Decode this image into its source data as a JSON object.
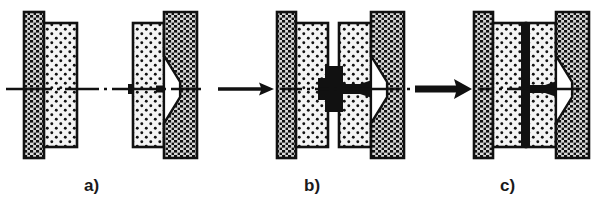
{
  "figure": {
    "background_color": "#ffffff",
    "ink_color": "#111111",
    "die_fill_color": "#f2f2f2",
    "clamp_fill_color": "#d9d9d9",
    "weld_color": "#111111",
    "panels": [
      {
        "id": "a",
        "label": "a)",
        "stage_name": "tool-open",
        "has_arrow": false,
        "arrow_weight": "none",
        "weld_shape": "small-nub",
        "gap": "wide"
      },
      {
        "id": "b",
        "label": "b)",
        "stage_name": "tool-approaching",
        "has_arrow": true,
        "arrow_weight": "thin",
        "weld_shape": "upset-bulge",
        "gap": "narrow"
      },
      {
        "id": "c",
        "label": "c)",
        "stage_name": "tool-closed",
        "has_arrow": true,
        "arrow_weight": "thick",
        "weld_shape": "thin-seam",
        "gap": "closed"
      }
    ],
    "parts": {
      "outer_clamp": "hatched-clamp-plate",
      "inner_die": "dotted-die-block",
      "funnel_cavity": "conical-white-cavity",
      "centerline": "dash-dot-axis",
      "workpiece": "black-upset-material"
    },
    "labels": {
      "a": "a)",
      "b": "b)",
      "c": "c)"
    }
  }
}
